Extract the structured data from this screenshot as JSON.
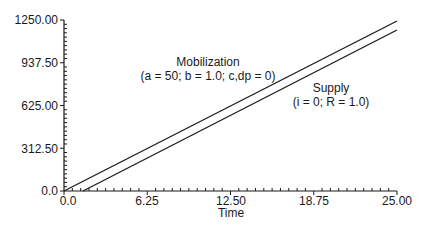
{
  "chart_data": {
    "type": "line",
    "title": "",
    "xlabel": "Time",
    "ylabel": "",
    "xlim": [
      0,
      25
    ],
    "ylim": [
      0,
      1250
    ],
    "x_ticks": [
      "0.0",
      "6.25",
      "12.50",
      "18.75",
      "25.00"
    ],
    "y_ticks": [
      "0.0",
      "312.50",
      "625.00",
      "937.50",
      "1250.00"
    ],
    "grid": false,
    "legend": "none",
    "series": [
      {
        "name": "Mobilization",
        "x": [
          0,
          25
        ],
        "y": [
          0,
          1250
        ]
      },
      {
        "name": "Supply",
        "x": [
          1.4,
          25
        ],
        "y": [
          0,
          1180
        ]
      }
    ],
    "annotations": [
      {
        "text": "Mobilization",
        "x": 10.4,
        "y": 870
      },
      {
        "text": "(a = 50; b = 1.0; c,dp = 0)",
        "x": 10.4,
        "y": 770
      },
      {
        "text": "Supply",
        "x": 17.7,
        "y": 680
      },
      {
        "text": "(i = 0; R = 1.0)",
        "x": 17.5,
        "y": 580
      }
    ]
  },
  "labels": {
    "xlabel": "Time",
    "x_ticks": [
      "0.0",
      "6.25",
      "12.50",
      "18.75",
      "25.00"
    ],
    "y_ticks": [
      "0.0",
      "312.50",
      "625.00",
      "937.50",
      "1250.00"
    ],
    "mob_title": "Mobilization",
    "mob_params": "(a = 50; b = 1.0; c,dp = 0)",
    "sup_title": "Supply",
    "sup_params": "(i = 0; R = 1.0)"
  }
}
